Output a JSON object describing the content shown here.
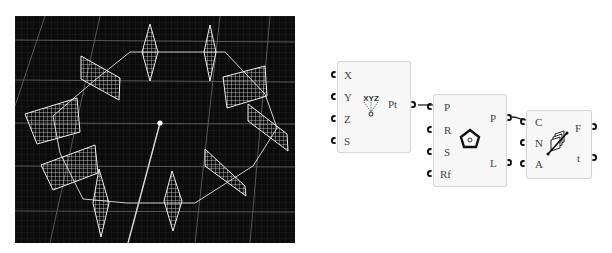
{
  "viewport": {
    "background": "#0b0b0b",
    "grid_color": "#555555",
    "geometry_color": "#e6e6e6",
    "center_point": {
      "x": 145,
      "y": 107
    },
    "panel_count": 12
  },
  "components": [
    {
      "name": "construct-point",
      "inputs": [
        "X",
        "Y",
        "Z",
        "S"
      ],
      "outputs": [
        "Pt"
      ],
      "icon": "xyz-point-icon",
      "icon_text": "XYZ"
    },
    {
      "name": "polygon",
      "inputs": [
        "P",
        "R",
        "S",
        "Rf"
      ],
      "outputs": [
        "P",
        "L"
      ],
      "icon": "pentagon-icon"
    },
    {
      "name": "divide-frames",
      "inputs": [
        "C",
        "N",
        "A"
      ],
      "outputs": [
        "F",
        "t"
      ],
      "icon": "frames-icon"
    }
  ],
  "wires": [
    {
      "from": "construct-point.Pt",
      "to": "polygon.P"
    },
    {
      "from": "polygon.P",
      "to": "divide-frames.C"
    }
  ]
}
